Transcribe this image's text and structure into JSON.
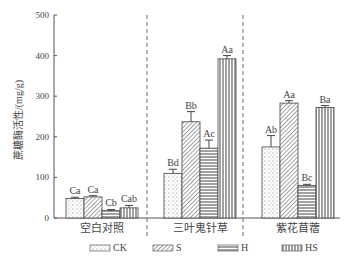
{
  "chart_data": {
    "type": "bar",
    "title": "",
    "ylabel": "蔗糖酶活性/(mg/g)",
    "xlabel": "",
    "ylim": [
      0,
      500
    ],
    "yticks": [
      0,
      100,
      200,
      300,
      400,
      500
    ],
    "categories": [
      "空白对照",
      "三叶鬼针草",
      "紫花苜蓿"
    ],
    "series": [
      {
        "name": "CK",
        "values": [
          48,
          110,
          175
        ],
        "errors": [
          3,
          10,
          28
        ],
        "labels": [
          "Ca",
          "Bd",
          "Ab"
        ]
      },
      {
        "name": "S",
        "values": [
          52,
          237,
          283
        ],
        "errors": [
          3,
          25,
          6
        ],
        "labels": [
          "Ca",
          "Bb",
          "Aa"
        ]
      },
      {
        "name": "H",
        "values": [
          18,
          172,
          80
        ],
        "errors": [
          3,
          20,
          3
        ],
        "labels": [
          "Cb",
          "Ac",
          "Bc"
        ]
      },
      {
        "name": "HS",
        "values": [
          25,
          392,
          272
        ],
        "errors": [
          6,
          8,
          5
        ],
        "labels": [
          "Cab",
          "Aa",
          "Ba"
        ]
      }
    ],
    "legend_position": "bottom",
    "grid": false
  },
  "legend": [
    "CK",
    "S",
    "H",
    "HS"
  ]
}
